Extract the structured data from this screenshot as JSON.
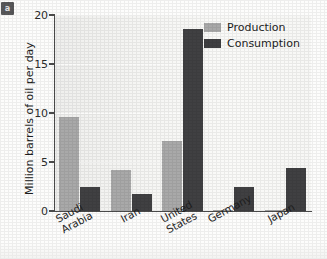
{
  "badge": {
    "label": "a"
  },
  "chart_data": {
    "type": "bar",
    "title": "",
    "xlabel": "",
    "ylabel": "Million barrels of oil per day",
    "ylim": [
      0,
      20
    ],
    "yticks": [
      0,
      5,
      10,
      15,
      20
    ],
    "ytick_labels": [
      "0",
      "5",
      "10",
      "15",
      "20"
    ],
    "grid": true,
    "grid_axis": "y",
    "legend_position": "top-right",
    "categories": [
      "Saudi\nArabia",
      "Iran",
      "United\nStates",
      "Germany",
      "Japan"
    ],
    "category_labels_flat": [
      "Saudi Arabia",
      "Iran",
      "United States",
      "Germany",
      "Japan"
    ],
    "series": [
      {
        "name": "Production",
        "color": "#a9a9a9",
        "values": [
          9.6,
          4.2,
          7.1,
          0.1,
          0.1
        ]
      },
      {
        "name": "Consumption",
        "color": "#404042",
        "values": [
          2.5,
          1.7,
          18.6,
          2.4,
          4.4
        ]
      }
    ]
  },
  "colors": {
    "production": "#a9a9a9",
    "consumption": "#404042",
    "axis": "#4a4a4a",
    "plot_background": "#f4f4f2",
    "text": "#1d1d1d"
  }
}
